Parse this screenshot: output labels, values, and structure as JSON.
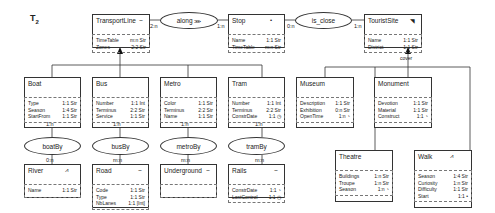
{
  "title": "T",
  "title_sub": "2",
  "entities": {
    "transportline": {
      "name": "TransportLine",
      "icon": "⌣",
      "attrs": [
        {
          "n": "TimeTable",
          "v": "m:n  Str"
        },
        {
          "n": "Zones",
          "v": "2:2  Str"
        }
      ]
    },
    "stop": {
      "name": "Stop",
      "icon": "•",
      "attrs": [
        {
          "n": "Name",
          "v": "1:1  Str"
        },
        {
          "n": "TimeTable",
          "v": "m:n  Str"
        }
      ]
    },
    "touristsite": {
      "name": "TouristSite",
      "icon": "◥",
      "attrs": [
        {
          "n": "Name",
          "v": "1:1  Str"
        },
        {
          "n": "District",
          "v": "1:1  Str"
        }
      ]
    },
    "boat": {
      "name": "Boat",
      "icon": "",
      "attrs": [
        {
          "n": "Type",
          "v": "1:1 Str"
        },
        {
          "n": "Season",
          "v": "1:4 Str"
        },
        {
          "n": "StartFrom",
          "v": "1:1 Str"
        }
      ]
    },
    "bus": {
      "name": "Bus",
      "icon": "",
      "attrs": [
        {
          "n": "Number",
          "v": "1:1 Int"
        },
        {
          "n": "Terminus",
          "v": "2:2 Str"
        },
        {
          "n": "Service",
          "v": "1:1 Str"
        }
      ]
    },
    "metro": {
      "name": "Metro",
      "icon": "",
      "attrs": [
        {
          "n": "Color",
          "v": "1:1 Str"
        },
        {
          "n": "Terminus",
          "v": "2:2 Str"
        },
        {
          "n": "Name",
          "v": "1:1 Str"
        }
      ]
    },
    "tram": {
      "name": "Tram",
      "icon": "",
      "attrs": [
        {
          "n": "Number",
          "v": "1:1 Int"
        },
        {
          "n": "Terminus",
          "v": "2:2 Str"
        },
        {
          "n": "ConstrDate",
          "v": "1:1 ◷"
        }
      ]
    },
    "museum": {
      "name": "Museum",
      "icon": "",
      "attrs": [
        {
          "n": "Description",
          "v": "1:1 Str"
        },
        {
          "n": "Exhibition",
          "v": "0:n Str"
        },
        {
          "n": "OpenTime",
          "v": "1:n ◔"
        }
      ]
    },
    "monument": {
      "name": "Monument",
      "icon": "",
      "attrs": [
        {
          "n": "Devotion",
          "v": "1:1 Str"
        },
        {
          "n": "Material",
          "v": "1:1 Str"
        },
        {
          "n": "Construct",
          "v": "1:1 ◔"
        }
      ]
    },
    "theatre": {
      "name": "Theatre",
      "icon": "",
      "attrs": [
        {
          "n": "Buildings",
          "v": "1:n Str"
        },
        {
          "n": "Troupe",
          "v": "1:n Str"
        },
        {
          "n": "Season",
          "v": "1:n ◔"
        }
      ]
    },
    "walk": {
      "name": "Walk",
      "icon": "⩘",
      "attrs": [
        {
          "n": "Season",
          "v": "1:4 Str"
        },
        {
          "n": "Curiosity",
          "v": "1:n Str"
        },
        {
          "n": "Difficulty",
          "v": "1:1 Str"
        },
        {
          "n": "Start",
          "v": "1:1 •"
        }
      ]
    },
    "river": {
      "name": "River",
      "icon": "⩘",
      "attrs": [
        {
          "n": "Name",
          "v": "1:1 Str"
        }
      ]
    },
    "road": {
      "name": "Road",
      "icon": "⌣",
      "attrs": [
        {
          "n": "Code",
          "v": "1:1 Str"
        },
        {
          "n": "Type",
          "v": "1:1 Str"
        },
        {
          "n": "NbLanes",
          "v": "1:1 [Int]"
        }
      ]
    },
    "underground": {
      "name": "Underground",
      "icon": "⌣",
      "attrs": []
    },
    "rails": {
      "name": "Rails",
      "icon": "⌣",
      "attrs": [
        {
          "n": "ConstrDate",
          "v": "1:1 ◔"
        },
        {
          "n": "LastControl",
          "v": "1:1 ◷"
        }
      ]
    }
  },
  "relationships": {
    "along": {
      "name": "along",
      "icon": "⋙",
      "card_left": "2:n",
      "card_right": "1:n"
    },
    "is_close": {
      "name": "is_close",
      "card_left": "0:n",
      "card_right": "1:n"
    },
    "boatBy": {
      "name": "boatBy",
      "card_top": "1:n",
      "card_bottom": "0:n"
    },
    "busBy": {
      "name": "busBy",
      "card_top": "1:n",
      "card_bottom": "m:n"
    },
    "metroBy": {
      "name": "metroBy",
      "card_top": "1:n",
      "card_bottom": "m:n"
    },
    "tramBy": {
      "name": "tramBy",
      "card_top": "1:n",
      "card_bottom": "m:n"
    }
  },
  "labels": {
    "cover": "cover"
  }
}
